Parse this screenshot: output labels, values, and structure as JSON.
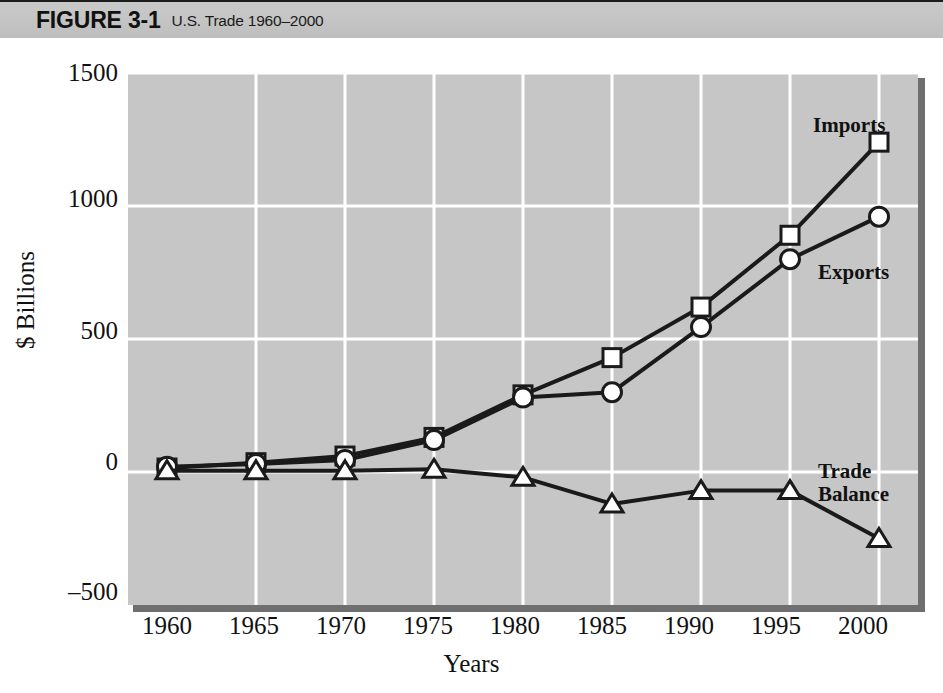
{
  "header": {
    "figure_label": "FIGURE 3-1",
    "caption": "U.S. Trade 1960–2000"
  },
  "axes": {
    "ylabel": "$ Billions",
    "xlabel": "Years",
    "yticks": [
      "1500",
      "1000",
      "500",
      "0",
      "–500"
    ],
    "xticks": [
      "1960",
      "1965",
      "1970",
      "1975",
      "1980",
      "1985",
      "1990",
      "1995",
      "2000"
    ]
  },
  "annotations": {
    "imports": "Imports",
    "exports": "Exports",
    "trade_balance": "Trade\nBalance"
  },
  "colors": {
    "header_bar": "#c4c4c4",
    "plot_background": "#c6c6c6",
    "gridline": "#ffffff",
    "series_line": "#1a1a1a",
    "marker_fill": "#ffffff",
    "shadow": "#6f6f6f"
  },
  "chart_data": {
    "type": "line",
    "title": "U.S. Trade 1960–2000",
    "xlabel": "Years",
    "ylabel": "$ Billions",
    "x": [
      1960,
      1965,
      1970,
      1975,
      1980,
      1985,
      1990,
      1995,
      2000
    ],
    "xlim": [
      1960,
      2000
    ],
    "ylim": [
      -500,
      1500
    ],
    "yticks": [
      -500,
      0,
      500,
      1000,
      1500
    ],
    "grid": true,
    "legend": "inline-annotations",
    "series": [
      {
        "name": "Imports",
        "marker": "open-square",
        "values": [
          15,
          35,
          60,
          130,
          290,
          430,
          620,
          890,
          1240
        ]
      },
      {
        "name": "Exports",
        "marker": "open-circle",
        "values": [
          20,
          30,
          45,
          120,
          280,
          300,
          545,
          800,
          960
        ]
      },
      {
        "name": "Trade Balance",
        "marker": "open-triangle",
        "values": [
          5,
          5,
          5,
          10,
          -20,
          -120,
          -70,
          -70,
          -250
        ]
      }
    ]
  }
}
